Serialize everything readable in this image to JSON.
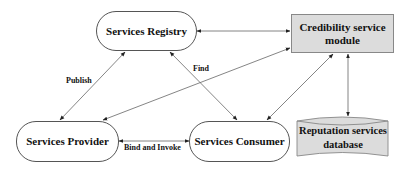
{
  "diagram": {
    "nodes": {
      "registry": {
        "label": "Services Registry",
        "shape": "rounded-pill"
      },
      "credibility": {
        "label": "Credibility service module",
        "line1": "Credibility service",
        "line2": "module",
        "shape": "rectangle",
        "fill": "#dcdcdc"
      },
      "provider": {
        "label": "Services Provider",
        "shape": "rounded-pill"
      },
      "consumer": {
        "label": "Services Consumer",
        "shape": "rounded-pill"
      },
      "database": {
        "label": "Reputation services database",
        "line1": "Reputation services",
        "line2": "database",
        "shape": "cylinder",
        "fill": "#dcdcdc"
      }
    },
    "edge_labels": {
      "publish": "Publish",
      "find": "Find",
      "bind_invoke": "Bind and Invoke"
    },
    "edges": [
      {
        "from": "provider",
        "to": "registry",
        "label": "Publish",
        "direction": "both"
      },
      {
        "from": "consumer",
        "to": "registry",
        "label": "Find",
        "direction": "both"
      },
      {
        "from": "provider",
        "to": "consumer",
        "label": "Bind and Invoke",
        "direction": "both"
      },
      {
        "from": "registry",
        "to": "credibility",
        "label": "",
        "direction": "both"
      },
      {
        "from": "provider",
        "to": "credibility",
        "label": "",
        "direction": "both"
      },
      {
        "from": "consumer",
        "to": "credibility",
        "label": "",
        "direction": "both"
      },
      {
        "from": "credibility",
        "to": "database",
        "label": "",
        "direction": "both"
      }
    ],
    "colors": {
      "line": "#444444",
      "box_fill": "#dcdcdc",
      "pill_border": "#555555"
    }
  }
}
